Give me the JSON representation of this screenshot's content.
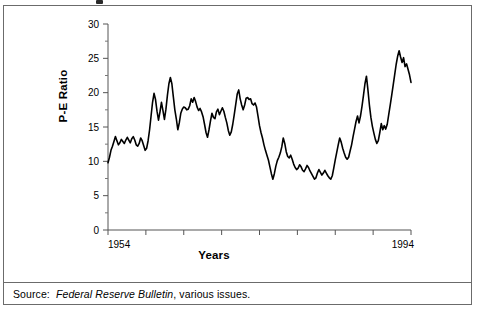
{
  "figure": {
    "source_prefix": "Source:",
    "source_italic": "Federal Reserve Bulletin",
    "source_rest": ", various issues."
  },
  "chart_data": {
    "type": "line",
    "title": "",
    "xlabel": "Years",
    "ylabel": "P-E Ratio",
    "xlim": [
      1954,
      1994
    ],
    "ylim": [
      0,
      30
    ],
    "x_tick_labels": [
      "1954",
      "1994"
    ],
    "y_tick_labels": [
      "0",
      "5",
      "10",
      "15",
      "20",
      "25",
      "30"
    ],
    "y_major_ticks": [
      0,
      5,
      10,
      15,
      20,
      25,
      30
    ],
    "y_minor_step": 2.5,
    "x_major_tick_count": 9,
    "grid": false,
    "legend": null,
    "line_color": "#000000",
    "line_width": 1.6,
    "x_start": 1954.0,
    "x_step": 0.25,
    "values": [
      9.8,
      10.6,
      11.6,
      12.2,
      12.9,
      13.6,
      13.0,
      12.4,
      12.7,
      13.2,
      12.9,
      12.6,
      13.1,
      13.5,
      13.1,
      12.7,
      13.3,
      13.6,
      13.1,
      12.4,
      12.2,
      12.6,
      13.4,
      13.0,
      12.3,
      11.6,
      11.9,
      13.0,
      14.6,
      16.6,
      18.6,
      19.9,
      19.0,
      17.3,
      16.0,
      17.2,
      18.6,
      17.4,
      16.1,
      17.6,
      19.6,
      21.3,
      22.2,
      21.3,
      19.4,
      17.5,
      16.2,
      14.6,
      15.6,
      17.0,
      17.6,
      17.9,
      17.8,
      17.5,
      17.6,
      18.1,
      19.1,
      18.6,
      19.3,
      18.7,
      17.9,
      17.4,
      17.7,
      17.2,
      16.5,
      15.4,
      14.2,
      13.5,
      14.6,
      15.9,
      17.0,
      16.4,
      16.2,
      17.2,
      17.6,
      16.8,
      17.3,
      17.8,
      17.3,
      16.4,
      15.6,
      14.5,
      13.8,
      14.3,
      15.4,
      16.8,
      18.3,
      19.8,
      20.4,
      19.1,
      18.2,
      17.5,
      18.2,
      19.2,
      19.3,
      19.0,
      19.1,
      18.4,
      18.2,
      18.5,
      17.9,
      16.6,
      15.2,
      14.2,
      13.4,
      12.4,
      11.6,
      10.9,
      10.2,
      9.2,
      8.2,
      7.4,
      8.2,
      9.3,
      10.1,
      10.6,
      11.2,
      12.1,
      13.4,
      12.6,
      11.4,
      10.7,
      10.5,
      10.9,
      10.3,
      9.6,
      9.1,
      8.8,
      9.0,
      9.5,
      9.2,
      8.7,
      8.5,
      8.9,
      9.4,
      9.1,
      8.6,
      8.2,
      7.8,
      7.4,
      7.6,
      8.3,
      8.8,
      8.4,
      8.0,
      8.3,
      8.7,
      8.3,
      7.9,
      7.6,
      7.4,
      7.9,
      9.0,
      10.2,
      11.3,
      12.4,
      13.4,
      12.8,
      11.9,
      11.2,
      10.6,
      10.3,
      10.6,
      11.5,
      12.4,
      13.6,
      14.7,
      15.8,
      16.6,
      15.6,
      16.6,
      18.0,
      19.6,
      21.3,
      22.4,
      20.4,
      18.2,
      16.4,
      15.1,
      14.1,
      13.2,
      12.6,
      13.0,
      14.2,
      15.5,
      14.6,
      15.2,
      14.7,
      15.4,
      16.8,
      18.2,
      19.6,
      21.1,
      22.6,
      24.1,
      25.3,
      26.1,
      25.2,
      24.4,
      25.1,
      23.8,
      24.2,
      23.4,
      22.6,
      21.5
    ]
  },
  "axis": {
    "x_min_label": "1954",
    "x_max_label": "1994"
  }
}
